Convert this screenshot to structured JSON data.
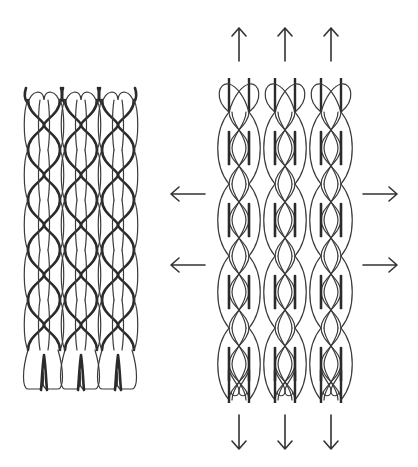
{
  "figure": {
    "description": "Stent in compressed state (left) and expanded state (right) with arrows indicating radial and axial expansion",
    "panels": [
      {
        "id": "compressed",
        "label": "Compressed stent",
        "units": 3
      },
      {
        "id": "expanded",
        "label": "Expanded stent",
        "units": 3
      }
    ],
    "arrows": {
      "up": 3,
      "down": 3,
      "left": 2,
      "right": 2
    },
    "colors": {
      "stroke": "#2b2b2b",
      "background": "#ffffff"
    }
  }
}
